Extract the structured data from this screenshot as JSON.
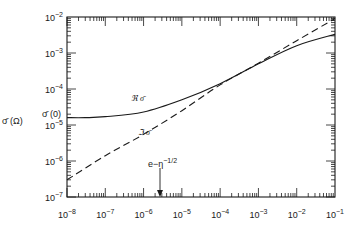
{
  "chart_data": {
    "type": "line",
    "title": "",
    "xlabel": "",
    "ylabel": "σ̄ (Ω)",
    "xscale": "log",
    "yscale": "log",
    "xlim": [
      1e-08,
      0.1
    ],
    "ylim": [
      1e-07,
      0.01
    ],
    "x_ticks": [
      "10^-8",
      "10^-7",
      "10^-6",
      "10^-5",
      "10^-4",
      "10^-3",
      "10^-2",
      "10^-1"
    ],
    "y_ticks": [
      "10^-7",
      "10^-6",
      "10^-5",
      "10^-4",
      "10^-3",
      "10^-2"
    ],
    "grid": false,
    "series": [
      {
        "name": "ℜ σ̄",
        "style": "solid",
        "x": [
          1e-08,
          3e-08,
          1e-07,
          1e-06,
          1e-05,
          0.0001,
          0.001,
          0.01,
          0.1
        ],
        "y": [
          1.6e-05,
          1.6e-05,
          1.7e-05,
          2.3e-05,
          5e-05,
          0.00014,
          0.0005,
          0.0016,
          0.0033
        ]
      },
      {
        "name": "ℑ σ̄",
        "style": "dashed",
        "x": [
          1e-08,
          1e-07,
          1e-06,
          1e-05,
          0.0001,
          0.001,
          0.01,
          0.1
        ],
        "y": [
          3e-07,
          1.4e-06,
          5.5e-06,
          2.5e-05,
          0.00013,
          0.00052,
          0.0022,
          0.009
        ]
      }
    ],
    "annotations": [
      {
        "text": "σ̄ (0)",
        "at_y": 1.6e-05,
        "position": "left axis"
      },
      {
        "text": "ℜ σ̄",
        "near": [
          5e-06,
          3.5e-05
        ]
      },
      {
        "text": "ℑ σ̄",
        "near": [
          5e-06,
          9e-06
        ]
      },
      {
        "text": "e^{-η^{-1/2}}",
        "arrow_x": 2.7e-06
      }
    ]
  },
  "labels": {
    "y_axis": "σ̄ (Ω)",
    "sigma0": "σ̄ (0)",
    "real": "ℜ σ̄",
    "imag": "ℑ σ̄",
    "arrow_base": "e",
    "arrow_exp_eta": "−η",
    "arrow_exp_pow": "−1/2",
    "decade_base": "10"
  }
}
